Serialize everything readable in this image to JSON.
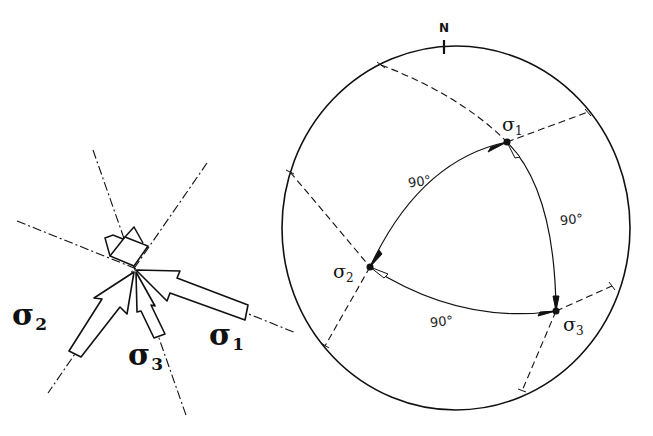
{
  "left_figure": {
    "labels": {
      "sigma1": {
        "symbol": "σ",
        "subscript": "1"
      },
      "sigma2": {
        "symbol": "σ",
        "subscript": "2"
      },
      "sigma3": {
        "symbol": "σ",
        "subscript": "3"
      }
    }
  },
  "stereonet": {
    "north_label": "N",
    "points": {
      "sigma1": {
        "symbol": "σ",
        "subscript": "1"
      },
      "sigma2": {
        "symbol": "σ",
        "subscript": "2"
      },
      "sigma3": {
        "symbol": "σ",
        "subscript": "3"
      }
    },
    "angles": {
      "sigma1_sigma2": "90°",
      "sigma1_sigma3": "90°",
      "sigma2_sigma3": "90°"
    }
  },
  "colors": {
    "ink": "#111111",
    "background": "#ffffff"
  }
}
